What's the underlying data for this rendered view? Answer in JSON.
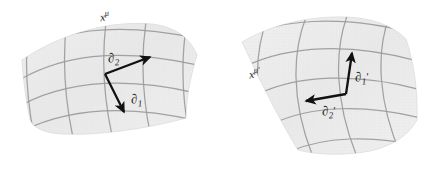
{
  "figure": {
    "title_semantic": "coordinate-chart-basis-vectors-diagram",
    "background_color": "#ffffff"
  },
  "style": {
    "surface_fill": "#ececec",
    "surface_fill_light": "#f2f2f2",
    "grid_line_color": "#9a9a9a",
    "surface_edge_color": "#d8d8d8",
    "arrow_color": "#111111",
    "label_color": "#1a1a1a"
  },
  "panels": [
    {
      "id": "left-panel",
      "name": "unprimed-coordinate-patch",
      "chart_label": {
        "base": "x",
        "superscript": "μ",
        "prime": "",
        "full": "xμ"
      },
      "basis_vectors": [
        {
          "id": "d2",
          "name": "basis-vector-partial-2",
          "symbol": "∂",
          "index": "2",
          "prime": "",
          "full": "∂2",
          "direction": "up-right"
        },
        {
          "id": "d1",
          "name": "basis-vector-partial-1",
          "symbol": "∂",
          "index": "1",
          "prime": "",
          "full": "∂1",
          "direction": "down-right"
        }
      ]
    },
    {
      "id": "right-panel",
      "name": "primed-coordinate-patch",
      "chart_label": {
        "base": "x",
        "superscript": "μ",
        "prime": "′",
        "full": "xμ′"
      },
      "basis_vectors": [
        {
          "id": "d1prime",
          "name": "basis-vector-partial-1-prime",
          "symbol": "∂",
          "index": "1",
          "prime": "′",
          "full": "∂1′",
          "direction": "up-slightly-right"
        },
        {
          "id": "d2prime",
          "name": "basis-vector-partial-2-prime",
          "symbol": "∂",
          "index": "2",
          "prime": "′",
          "full": "∂2′",
          "direction": "left-slightly-down"
        }
      ]
    }
  ]
}
